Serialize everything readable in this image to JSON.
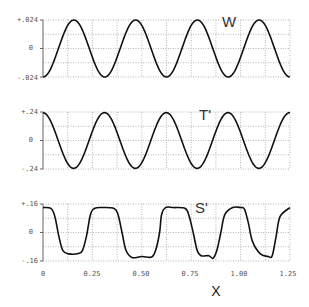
{
  "chart_data": [
    {
      "type": "line",
      "panel": "W",
      "label": "W",
      "ylim": [
        -0.024,
        0.024
      ],
      "yticks": [
        "+.024",
        "0",
        "-.024"
      ],
      "xlim": [
        0,
        1.25
      ],
      "grid": true,
      "x": [
        0,
        0.0625,
        0.125,
        0.1875,
        0.25,
        0.3125,
        0.375,
        0.4375,
        0.5,
        0.5625,
        0.625,
        0.6875,
        0.75,
        0.8125,
        0.875,
        0.9375,
        1.0,
        1.0625,
        1.125,
        1.1875,
        1.25
      ],
      "values": [
        -0.024,
        0.0,
        0.024,
        0.0,
        -0.024,
        0.0,
        0.024,
        0.0,
        -0.024,
        0.0,
        0.024,
        0.0,
        -0.024,
        0.0,
        0.024,
        0.0,
        -0.024,
        0.0,
        0.024,
        0.0,
        -0.024
      ]
    },
    {
      "type": "line",
      "panel": "T'",
      "label": "T'",
      "ylim": [
        -0.24,
        0.24
      ],
      "yticks": [
        "+.24",
        "0",
        "-.24"
      ],
      "xlim": [
        0,
        1.25
      ],
      "grid": true,
      "x": [
        0,
        0.0625,
        0.125,
        0.1875,
        0.25,
        0.3125,
        0.375,
        0.4375,
        0.5,
        0.5625,
        0.625,
        0.6875,
        0.75,
        0.8125,
        0.875,
        0.9375,
        1.0,
        1.0625,
        1.125,
        1.1875,
        1.25
      ],
      "values": [
        0.2,
        0.05,
        -0.22,
        -0.05,
        0.23,
        0.06,
        -0.23,
        -0.05,
        0.235,
        0.05,
        -0.235,
        -0.05,
        0.225,
        0.05,
        -0.225,
        -0.05,
        0.2,
        0.0,
        -0.2,
        0.05,
        0.2
      ]
    },
    {
      "type": "line",
      "panel": "S'",
      "label": "S'",
      "ylim": [
        -0.16,
        0.16
      ],
      "yticks": [
        "+.16",
        "0",
        "-.16"
      ],
      "xlim": [
        0,
        1.25
      ],
      "grid": true,
      "x": [
        0,
        0.04,
        0.06,
        0.08,
        0.1,
        0.13,
        0.18,
        0.2,
        0.22,
        0.24,
        0.26,
        0.3,
        0.36,
        0.38,
        0.4,
        0.42,
        0.45,
        0.5,
        0.55,
        0.57,
        0.59,
        0.6,
        0.62,
        0.66,
        0.72,
        0.74,
        0.76,
        0.78,
        0.8,
        0.84,
        0.86,
        0.88,
        0.9,
        0.92,
        0.96,
        1.0,
        1.02,
        1.04,
        1.06,
        1.1,
        1.14,
        1.16,
        1.18,
        1.2,
        1.25
      ],
      "values": [
        0.14,
        0.135,
        0.09,
        -0.02,
        -0.1,
        -0.12,
        -0.118,
        -0.1,
        -0.02,
        0.1,
        0.135,
        0.14,
        0.135,
        0.1,
        0.0,
        -0.1,
        -0.14,
        -0.135,
        -0.138,
        -0.1,
        0.0,
        0.1,
        0.14,
        0.14,
        0.135,
        0.09,
        0.0,
        -0.1,
        -0.13,
        -0.13,
        -0.145,
        -0.1,
        0.0,
        0.1,
        0.14,
        0.14,
        0.13,
        0.05,
        -0.05,
        -0.12,
        -0.135,
        -0.13,
        -0.02,
        0.09,
        0.14
      ]
    }
  ],
  "xaxis": {
    "label": "X",
    "ticks": [
      "0",
      "0.25",
      "0.50",
      "0.75",
      "1.00",
      "1.25"
    ],
    "tick_values": [
      0,
      0.25,
      0.5,
      0.75,
      1.0,
      1.25
    ]
  },
  "panels": [
    {
      "label": "W",
      "ytick_top": "+.024",
      "ytick_mid": "0",
      "ytick_bot": "-.024"
    },
    {
      "label": "T'",
      "ytick_top": "+.24",
      "ytick_mid": "0",
      "ytick_bot": "-.24"
    },
    {
      "label": "S'",
      "ytick_top": "+.16",
      "ytick_mid": "0",
      "ytick_bot": "-.16"
    }
  ],
  "colors": {
    "curve": "#111111",
    "grid": "#9a9a9a",
    "text": "#555555"
  }
}
